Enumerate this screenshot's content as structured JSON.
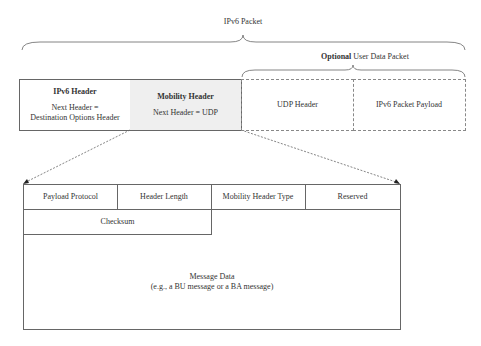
{
  "diagram": {
    "top_brace_label": "IPv6 Packet",
    "optional_brace_label_bold": "Optional",
    "optional_brace_label_rest": " User Data Packet",
    "packet_row": [
      {
        "title": "IPv6 Header",
        "detail_line1": "Next Header =",
        "detail_line2": "Destination Options Header"
      },
      {
        "title": "Mobility Header",
        "detail_line1": "Next Header = UDP"
      },
      {
        "title": "UDP Header"
      },
      {
        "title": "IPv6 Packet Payload"
      }
    ],
    "mobility_header_fields": {
      "row1": [
        "Payload Protocol",
        "Header Length",
        "Mobility Header Type",
        "Reserved"
      ],
      "checksum": "Checksum",
      "message_data_line1": "Message Data",
      "message_data_line2": "(e.g., a BU message or a BA message)"
    },
    "colors": {
      "mobility_header_bg": "#efefef",
      "line": "#666666"
    }
  }
}
